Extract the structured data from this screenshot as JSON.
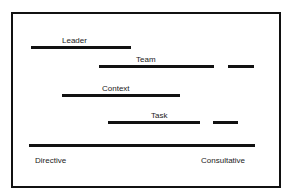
{
  "diagram": {
    "title": "",
    "colors": {
      "line": "#111111",
      "text": "#222222",
      "background": "#ffffff"
    },
    "rows": [
      {
        "label": "Leader",
        "segments": [
          [
            31,
            131
          ]
        ],
        "y": 47,
        "label_x": 62,
        "label_y": 36
      },
      {
        "label": "Team",
        "segments": [
          [
            99,
            214
          ],
          [
            228,
            254
          ]
        ],
        "y": 66,
        "label_x": 136,
        "label_y": 55
      },
      {
        "label": "Context",
        "segments": [
          [
            62,
            180
          ]
        ],
        "y": 94,
        "label_x": 102,
        "label_y": 84
      },
      {
        "label": "Task",
        "segments": [
          [
            108,
            200
          ],
          [
            213,
            238
          ]
        ],
        "y": 121,
        "label_x": 151,
        "label_y": 111
      }
    ],
    "axis": {
      "segment": [
        29,
        255
      ],
      "y": 144,
      "left_label": "Directive",
      "right_label": "Consultative"
    }
  }
}
